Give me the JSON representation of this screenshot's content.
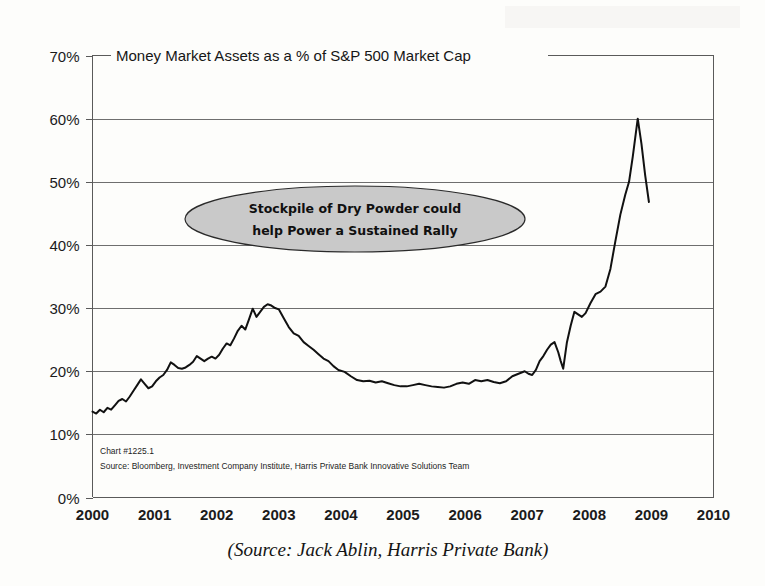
{
  "chart_data": {
    "type": "line",
    "title": "Money Market Assets as a % of S&P 500 Market Cap",
    "xlabel": "",
    "ylabel": "",
    "xlim": [
      2000,
      2010
    ],
    "ylim": [
      0,
      70
    ],
    "grid": true,
    "legend": false,
    "y_tick_labels": [
      "0%",
      "10%",
      "20%",
      "30%",
      "40%",
      "50%",
      "60%",
      "70%"
    ],
    "y_tick_values": [
      0,
      10,
      20,
      30,
      40,
      50,
      60,
      70
    ],
    "x_tick_labels": [
      "2000",
      "2001",
      "2002",
      "2003",
      "2004",
      "2005",
      "2006",
      "2007",
      "2008",
      "2009",
      "2010"
    ],
    "x_tick_values": [
      2000,
      2001,
      2002,
      2003,
      2004,
      2005,
      2006,
      2007,
      2008,
      2009,
      2010
    ],
    "series": [
      {
        "name": "Money Market Assets as a % of S&P 500 Market Cap",
        "color": "#111111",
        "x": [
          2000.0,
          2000.06,
          2000.12,
          2000.18,
          2000.24,
          2000.3,
          2000.36,
          2000.42,
          2000.48,
          2000.54,
          2000.6,
          2000.66,
          2000.72,
          2000.78,
          2000.84,
          2000.9,
          2000.96,
          2001.02,
          2001.08,
          2001.14,
          2001.2,
          2001.26,
          2001.32,
          2001.38,
          2001.44,
          2001.5,
          2001.56,
          2001.62,
          2001.68,
          2001.74,
          2001.8,
          2001.86,
          2001.92,
          2001.98,
          2002.04,
          2002.1,
          2002.16,
          2002.22,
          2002.28,
          2002.34,
          2002.4,
          2002.46,
          2002.52,
          2002.58,
          2002.64,
          2002.7,
          2002.76,
          2002.82,
          2002.88,
          2002.94,
          2003.0,
          2003.08,
          2003.16,
          2003.24,
          2003.32,
          2003.4,
          2003.48,
          2003.56,
          2003.64,
          2003.72,
          2003.8,
          2003.88,
          2003.96,
          2004.06,
          2004.16,
          2004.26,
          2004.36,
          2004.46,
          2004.56,
          2004.66,
          2004.76,
          2004.86,
          2004.96,
          2005.06,
          2005.16,
          2005.26,
          2005.36,
          2005.46,
          2005.56,
          2005.66,
          2005.76,
          2005.86,
          2005.96,
          2006.06,
          2006.16,
          2006.26,
          2006.36,
          2006.46,
          2006.56,
          2006.66,
          2006.76,
          2006.86,
          2006.96,
          2007.02,
          2007.08,
          2007.14,
          2007.2,
          2007.26,
          2007.32,
          2007.38,
          2007.44,
          2007.5,
          2007.54,
          2007.58,
          2007.64,
          2007.7,
          2007.76,
          2007.82,
          2007.88,
          2007.94,
          2008.02,
          2008.1,
          2008.18,
          2008.26,
          2008.34,
          2008.42,
          2008.5,
          2008.58,
          2008.64,
          2008.7,
          2008.74,
          2008.78,
          2008.84,
          2008.9,
          2008.96
        ],
        "y": [
          13.6,
          13.3,
          13.9,
          13.5,
          14.2,
          13.9,
          14.6,
          15.3,
          15.6,
          15.2,
          16.0,
          16.9,
          17.8,
          18.7,
          18.0,
          17.3,
          17.6,
          18.4,
          19.0,
          19.4,
          20.2,
          21.4,
          21.0,
          20.5,
          20.4,
          20.6,
          21.0,
          21.5,
          22.4,
          22.0,
          21.6,
          22.0,
          22.3,
          22.0,
          22.6,
          23.6,
          24.4,
          24.1,
          25.2,
          26.4,
          27.2,
          26.6,
          28.2,
          29.9,
          28.6,
          29.4,
          30.2,
          30.6,
          30.4,
          30.0,
          29.8,
          28.4,
          27.0,
          26.0,
          25.6,
          24.6,
          24.0,
          23.4,
          22.7,
          22.0,
          21.6,
          20.8,
          20.2,
          19.9,
          19.2,
          18.6,
          18.4,
          18.5,
          18.2,
          18.4,
          18.1,
          17.8,
          17.6,
          17.6,
          17.8,
          18.0,
          17.8,
          17.6,
          17.5,
          17.4,
          17.6,
          18.0,
          18.2,
          18.0,
          18.6,
          18.4,
          18.6,
          18.3,
          18.1,
          18.4,
          19.2,
          19.6,
          20.0,
          19.6,
          19.4,
          20.2,
          21.6,
          22.4,
          23.4,
          24.2,
          24.6,
          23.0,
          21.6,
          20.4,
          24.6,
          27.2,
          29.4,
          29.0,
          28.6,
          29.2,
          30.8,
          32.2,
          32.6,
          33.4,
          36.2,
          40.6,
          44.8,
          48.0,
          50.0,
          54.0,
          57.0,
          60.0,
          56.0,
          51.0,
          46.8
        ]
      }
    ],
    "annotations": [
      {
        "name": "callout-ellipse",
        "shape": "ellipse",
        "line1": "Stockpile of Dry Powder could",
        "line2": "help Power a Sustained Rally",
        "fill": "#c9c9c9",
        "stroke": "#2a2a2a"
      }
    ]
  },
  "footnote": {
    "chart_number": "Chart #1225.1",
    "source": "Source: Bloomberg, Investment Company Institute, Harris Private Bank Innovative Solutions Team"
  },
  "caption": {
    "text": "(Source: Jack Ablin, Harris Private Bank)"
  },
  "colors": {
    "background": "#fdfdfb",
    "line": "#111111",
    "grid": "#6e6e6e",
    "axis": "#5a5a5a",
    "callout_fill": "#c9c9c9"
  }
}
